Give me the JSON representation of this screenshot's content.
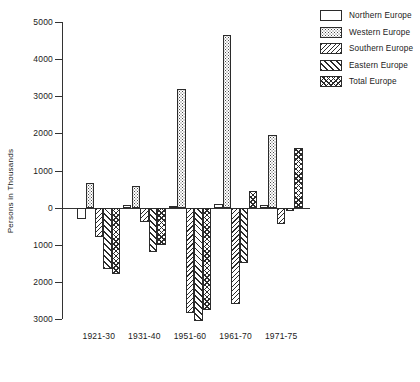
{
  "chart_data": {
    "type": "bar",
    "title": "",
    "subtitle": "",
    "xlabel": "",
    "ylabel": "Persons in Thousands",
    "ylim": [
      -3000,
      5000
    ],
    "ytick_step": 1000,
    "yticks": [
      "5000",
      "4000",
      "3000",
      "2000",
      "1000",
      "0",
      "1000",
      "2000",
      "3000"
    ],
    "ytick_values": [
      5000,
      4000,
      3000,
      2000,
      1000,
      0,
      -1000,
      -2000,
      -3000
    ],
    "grid": false,
    "legend_position": "top-right",
    "orientation": "vertical",
    "grouped": true,
    "zero_line": true,
    "categories": [
      "1921-30",
      "1931-40",
      "1951-60",
      "1961-70",
      "1971-75"
    ],
    "series": [
      {
        "name": "Northern Europe",
        "pattern": "empty",
        "values": [
          -300,
          80,
          50,
          100,
          60
        ]
      },
      {
        "name": "Western Europe",
        "pattern": "dots",
        "values": [
          650,
          580,
          3200,
          4650,
          1950
        ]
      },
      {
        "name": "Southern Europe",
        "pattern": "backslash-hatch",
        "values": [
          -800,
          -400,
          -2850,
          -2600,
          -450
        ]
      },
      {
        "name": "Eastern Europe",
        "pattern": "forward-slash-hatch",
        "values": [
          -1650,
          -1200,
          -3050,
          -1500,
          -100
        ]
      },
      {
        "name": "Total Europe",
        "pattern": "cross-hatch",
        "values": [
          -1800,
          -1000,
          -2750,
          450,
          1600
        ]
      }
    ]
  },
  "legend": {
    "items": [
      {
        "label": "Northern Europe",
        "pattern": "empty"
      },
      {
        "label": "Western Europe",
        "pattern": "dots"
      },
      {
        "label": "Southern Europe",
        "pattern": "backslash-hatch"
      },
      {
        "label": "Eastern Europe",
        "pattern": "forward-slash-hatch"
      },
      {
        "label": "Total Europe",
        "pattern": "cross-hatch"
      }
    ]
  },
  "colors": {
    "axis": "#333333",
    "bar_outline": "#2b2b2b",
    "bar_fill": "#ffffff",
    "pattern_ink": "#2b2b2b",
    "background": "#ffffff",
    "text": "#1a1a1a"
  }
}
